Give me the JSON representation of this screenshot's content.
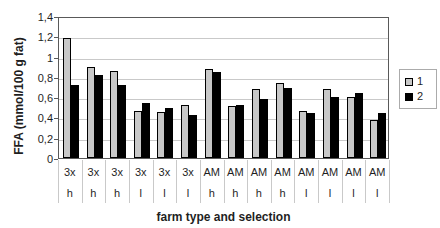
{
  "chart_data": {
    "type": "bar",
    "title": "",
    "xlabel": "farm type and selection",
    "ylabel": "FFA (mmol/100 g fat)",
    "ylim": [
      0,
      1.4
    ],
    "ytick_step": 0.2,
    "ytick_labels": [
      "0",
      "0,2",
      "0,4",
      "0,6",
      "0,8",
      "1",
      "1,2",
      "1,4"
    ],
    "grid": true,
    "legend_position": "right",
    "categories": [
      {
        "type": "3x",
        "sel": "h"
      },
      {
        "type": "3x",
        "sel": "h"
      },
      {
        "type": "3x",
        "sel": "h"
      },
      {
        "type": "3x",
        "sel": "l"
      },
      {
        "type": "3x",
        "sel": "l"
      },
      {
        "type": "3x",
        "sel": "l"
      },
      {
        "type": "AM",
        "sel": "h"
      },
      {
        "type": "AM",
        "sel": "h"
      },
      {
        "type": "AM",
        "sel": "h"
      },
      {
        "type": "AM",
        "sel": "h"
      },
      {
        "type": "AM",
        "sel": "l"
      },
      {
        "type": "AM",
        "sel": "l"
      },
      {
        "type": "AM",
        "sel": "l"
      },
      {
        "type": "AM",
        "sel": "l"
      }
    ],
    "series": [
      {
        "name": "1",
        "color": "#c8c8c8",
        "values": [
          1.18,
          0.9,
          0.86,
          0.46,
          0.45,
          0.52,
          0.88,
          0.51,
          0.68,
          0.74,
          0.46,
          0.68,
          0.6,
          0.37
        ]
      },
      {
        "name": "2",
        "color": "#000000",
        "values": [
          0.72,
          0.82,
          0.72,
          0.54,
          0.49,
          0.42,
          0.85,
          0.52,
          0.58,
          0.69,
          0.44,
          0.6,
          0.64,
          0.44
        ]
      }
    ]
  }
}
